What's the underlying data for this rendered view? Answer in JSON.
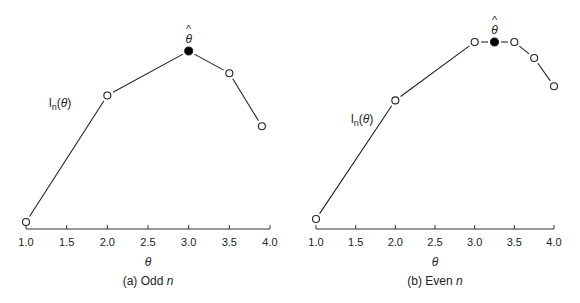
{
  "chart_data": [
    {
      "type": "line",
      "title": "",
      "caption_prefix": "(a) Odd ",
      "caption_italic": "n",
      "xlabel": "θ",
      "ylabel": "",
      "xlim": [
        1.0,
        4.0
      ],
      "xticks": [
        "1.0",
        "1.5",
        "2.0",
        "2.5",
        "3.0",
        "3.5",
        "4.0"
      ],
      "grid": false,
      "legend": null,
      "curve_label": "l",
      "curve_label_sub": "n",
      "curve_label_arg": "(θ)",
      "annotation": "θ̂",
      "series": [
        {
          "name": "l_n(θ)",
          "x": [
            1.0,
            2.0,
            3.0,
            3.5,
            3.9
          ],
          "y_relative": [
            0.0,
            0.74,
            1.0,
            0.87,
            0.56
          ],
          "markers": [
            "open",
            "open",
            "filled",
            "open",
            "open"
          ]
        }
      ],
      "max_point": {
        "x": 3.0,
        "label": "θ̂"
      }
    },
    {
      "type": "line",
      "title": "",
      "caption_prefix": "(b) Even ",
      "caption_italic": "n",
      "xlabel": "θ",
      "ylabel": "",
      "xlim": [
        1.0,
        4.0
      ],
      "xticks": [
        "1.0",
        "1.5",
        "2.0",
        "2.5",
        "3.0",
        "3.5",
        "4.0"
      ],
      "grid": false,
      "legend": null,
      "curve_label": "l",
      "curve_label_sub": "n",
      "curve_label_arg": "(θ)",
      "annotation": "θ̂",
      "series": [
        {
          "name": "l_n(θ)",
          "x": [
            1.0,
            2.0,
            3.0,
            3.25,
            3.5,
            3.75,
            4.0
          ],
          "y_relative": [
            0.0,
            0.67,
            1.0,
            1.0,
            1.0,
            0.91,
            0.75
          ],
          "markers": [
            "open",
            "open",
            "open",
            "filled",
            "open",
            "open",
            "open"
          ]
        }
      ],
      "max_point": {
        "x": 3.25,
        "label": "θ̂"
      }
    }
  ]
}
